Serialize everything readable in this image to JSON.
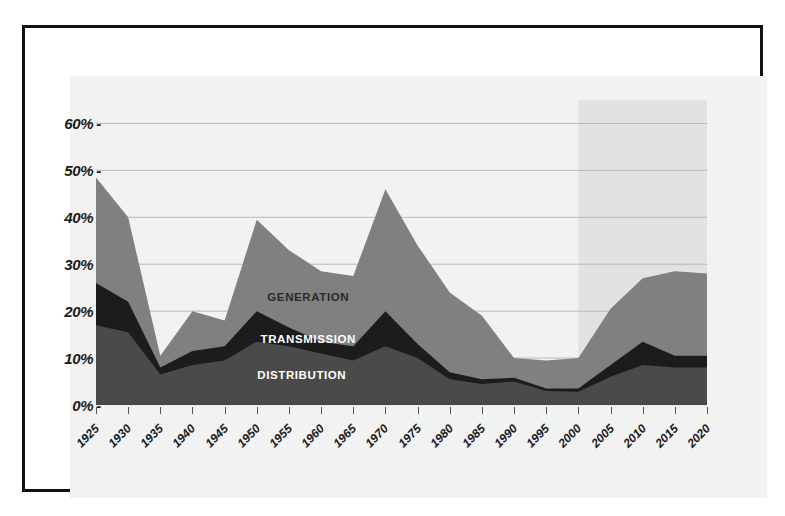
{
  "chart_data": {
    "type": "area",
    "title": "",
    "subtitle": "",
    "xlabel": "",
    "ylabel": "",
    "stacked": true,
    "grid": true,
    "legend_position": "in-chart",
    "ylim": [
      0,
      65
    ],
    "y_ticks": [
      "0%",
      "10%",
      "20%",
      "30%",
      "40%",
      "50%",
      "60%"
    ],
    "y_tick_values": [
      0,
      10,
      20,
      30,
      40,
      50,
      60
    ],
    "categories": [
      "1925",
      "1930",
      "1935",
      "1940",
      "1945",
      "1950",
      "1955",
      "1960",
      "1965",
      "1970",
      "1975",
      "1980",
      "1985",
      "1990",
      "1995",
      "2000",
      "2005",
      "2010",
      "2015",
      "2020"
    ],
    "series": [
      {
        "name": "DISTRIBUTION",
        "color": "#4a4a4a",
        "label_color": "#ffffff",
        "values": [
          17.0,
          15.5,
          6.5,
          8.5,
          9.5,
          13.5,
          12.5,
          11.0,
          9.5,
          12.5,
          10.0,
          5.5,
          4.5,
          5.0,
          3.0,
          2.8,
          6.0,
          8.5,
          8.0,
          8.0
        ]
      },
      {
        "name": "TRANSMISSION",
        "color": "#1c1c1c",
        "label_color": "#ffffff",
        "values": [
          9.0,
          6.5,
          1.5,
          3.0,
          3.0,
          6.5,
          4.0,
          2.5,
          3.0,
          7.5,
          3.0,
          1.5,
          1.0,
          0.8,
          0.5,
          0.7,
          2.5,
          5.0,
          2.5,
          2.5
        ]
      },
      {
        "name": "GENERATION",
        "color": "#808080",
        "label_color": "#2b2b2b",
        "values": [
          22.5,
          18.0,
          2.5,
          8.5,
          5.5,
          19.5,
          16.5,
          15.0,
          15.0,
          26.0,
          21.0,
          17.0,
          13.5,
          4.2,
          6.0,
          6.5,
          12.0,
          13.5,
          18.0,
          17.5
        ]
      }
    ],
    "totals": [
      48.5,
      40.0,
      10.5,
      20.0,
      18.0,
      39.5,
      33.0,
      28.5,
      27.5,
      46.0,
      34.0,
      24.0,
      19.0,
      10.0,
      9.5,
      10.0,
      20.5,
      27.0,
      28.5,
      28.0
    ],
    "annotations": [
      {
        "text": "GENERATION",
        "x_year": "1958",
        "y_value": 23.0
      },
      {
        "text": "TRANSMISSION",
        "x_year": "1958",
        "y_value": 14.0
      },
      {
        "text": "DISTRIBUTION",
        "x_year": "1957",
        "y_value": 6.5
      }
    ],
    "forecast_region": {
      "label": "",
      "start_year": "2000",
      "end_year": "2020",
      "shade_color": "#e2e2e2",
      "shade_top_value": 65
    },
    "colors": {
      "background": "#ffffff",
      "panel": "#f2f2f2",
      "frame": "#111111",
      "gridline": "#b9b9b9",
      "axis_text": "#1a1a1a"
    }
  }
}
